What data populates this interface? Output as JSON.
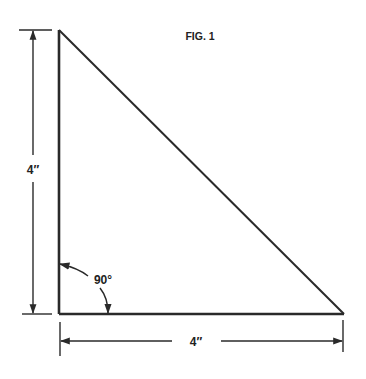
{
  "figure": {
    "title": "FIG. 1",
    "shape": "right triangle",
    "height_label": "4″",
    "base_label": "4″",
    "angle_label": "90°"
  },
  "colors": {
    "line": "#2a2a2a",
    "background": "#ffffff"
  }
}
